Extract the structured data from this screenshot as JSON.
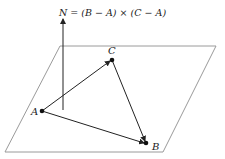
{
  "diagram": {
    "formula": "N = (B − A) × (C − A)",
    "points": {
      "A": {
        "label": "A",
        "x": 42,
        "y": 111
      },
      "B": {
        "label": "B",
        "x": 146,
        "y": 143
      },
      "C": {
        "label": "C",
        "x": 112,
        "y": 60
      }
    },
    "plane": {
      "corners": [
        [
          60,
          46
        ],
        [
          216,
          46
        ],
        [
          163,
          152
        ],
        [
          5,
          152
        ]
      ],
      "color": "#9a9a9a"
    },
    "normal": {
      "label": "N",
      "x": 63,
      "y_base": 110,
      "y_tip": 18
    },
    "colors": {
      "stroke": "#222222",
      "plane": "#9a9a9a"
    }
  }
}
